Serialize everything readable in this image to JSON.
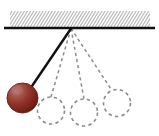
{
  "figure": {
    "canvas": {
      "width": 159,
      "height": 136,
      "background": "#ffffff"
    },
    "colors": {
      "ceiling_bar": "#101010",
      "hatch_line": "#b9b9b9",
      "string_solid": "#111111",
      "string_dashed": "#8c8c8c",
      "bob_highlight": "#b4736a",
      "bob_mid": "#9a3a30",
      "bob_dark": "#742017",
      "bob_outline": "#5e1a12",
      "ghost_circle": "#8c8c8c"
    },
    "support": {
      "label": "hatched ceiling support",
      "bar": {
        "x1": 4,
        "y1": 28,
        "x2": 155,
        "y2": 28,
        "thickness": 2.6
      },
      "hatch": {
        "x": 10,
        "y": 11,
        "width": 140,
        "height": 16,
        "angle_deg": 58,
        "spacing": 3.1,
        "stroke_width": 1.2
      }
    },
    "pivot": {
      "label": "pivot point",
      "x": 71,
      "y": 28.5
    },
    "bob": {
      "label": "pendulum bob at maximum displacement",
      "cx": 22.5,
      "cy": 98,
      "rx": 15.5,
      "ry": 15,
      "highlight_cx": 17,
      "highlight_cy": 90
    },
    "string_solid": {
      "label": "taut string at displaced position",
      "x1": 71,
      "y1": 28.5,
      "x2": 30,
      "y2": 89,
      "stroke_width": 2.4
    },
    "ghost_positions": [
      {
        "id": "ghost-1",
        "cx": 51,
        "cy": 110.5,
        "r": 13.5,
        "string_x2": 51,
        "string_y2": 97
      },
      {
        "id": "ghost-2",
        "cx": 84,
        "cy": 112.5,
        "r": 13.5,
        "string_x2": 84,
        "string_y2": 99
      },
      {
        "id": "ghost-3",
        "cx": 117,
        "cy": 103,
        "r": 13.5,
        "string_x2": 112,
        "string_y2": 90.5
      }
    ],
    "dash_pattern": {
      "string": "3.2 3.0",
      "circle": "3.4 3.2"
    }
  }
}
